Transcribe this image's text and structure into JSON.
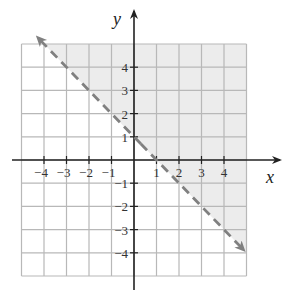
{
  "chart_data": {
    "type": "line",
    "title": "",
    "xlabel": "x",
    "ylabel": "y",
    "xlim": [
      -5,
      5
    ],
    "ylim": [
      -5,
      5
    ],
    "grid": true,
    "x_ticks": [
      -4,
      -3,
      -2,
      -1,
      1,
      2,
      3,
      4
    ],
    "y_ticks": [
      -4,
      -3,
      -2,
      -1,
      1,
      2,
      3,
      4
    ],
    "x_tick_labels": [
      "−4",
      "−3",
      "−2",
      "−1",
      "1",
      "2",
      "3",
      "4"
    ],
    "y_tick_labels": [
      "−4",
      "−3",
      "−2",
      "−1",
      "1",
      "2",
      "3",
      "4"
    ],
    "series": [
      {
        "name": "boundary line x + y = 1",
        "style": "dashed",
        "arrows": "both",
        "points": [
          [
            -4.5,
            5.5
          ],
          [
            0,
            1
          ],
          [
            1,
            0
          ],
          [
            5,
            -4
          ]
        ]
      }
    ],
    "shaded_region": {
      "description": "half-plane above/right of the dashed line (x + y > 1)",
      "inequality": "x + y > 1"
    },
    "colors": {
      "grid": "#b8b8b8",
      "axes": "#222222",
      "line": "#808080",
      "shade": "#ececec"
    }
  },
  "labels": {
    "x_axis": "x",
    "y_axis": "y"
  }
}
